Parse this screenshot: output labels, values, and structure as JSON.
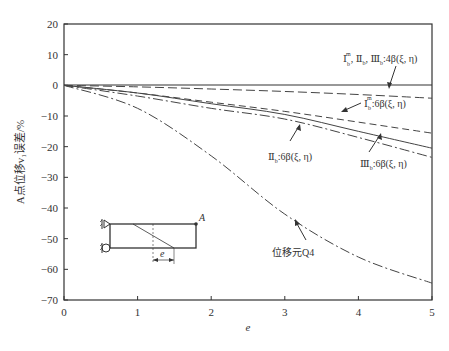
{
  "chart_data": {
    "type": "line",
    "title": "",
    "xlabel": "e",
    "ylabel": "A点位移v₁误差/%",
    "xlim": [
      0,
      5
    ],
    "ylim": [
      -70,
      20
    ],
    "xticks": [
      "0",
      "1",
      "2",
      "3",
      "4",
      "5"
    ],
    "yticks": [
      "20",
      "10",
      "0",
      "-10",
      "-20",
      "-30",
      "-40",
      "-50",
      "-60",
      "-70"
    ],
    "grid": false,
    "x": [
      0,
      1,
      2,
      3,
      4,
      5
    ],
    "series": [
      {
        "name": "Ⅰb^m, Ⅱb, Ⅲb:4β(ξ, η)",
        "style": "long-dash",
        "values": [
          0,
          -0.5,
          -1.2,
          -2.0,
          -3.0,
          -4.2
        ]
      },
      {
        "name": "Ⅰb^m:6β(ξ, η)",
        "style": "dash",
        "values": [
          0,
          -2.5,
          -5.5,
          -8.5,
          -12.0,
          -15.6
        ]
      },
      {
        "name": "Ⅱb:6β(ξ, η)",
        "style": "solid",
        "values": [
          0,
          -2.5,
          -6.0,
          -9.5,
          -15.0,
          -20.5
        ]
      },
      {
        "name": "Ⅲb:6β(ξ, η)",
        "style": "dash-dot",
        "values": [
          0,
          -3.5,
          -7.5,
          -11.0,
          -17.0,
          -23.5
        ]
      },
      {
        "name": "位移元Q4",
        "style": "dash-dot",
        "values": [
          0,
          -7.5,
          -23.0,
          -42.0,
          -56.0,
          -64.5
        ]
      }
    ],
    "annotations": [
      "Ⅰb^m, Ⅱb, Ⅲb:4β(ξ, η)",
      "Ⅰb^m:6β(ξ, η)",
      "Ⅱb:6β(ξ, η)",
      "Ⅲb:6β(ξ, η)",
      "位移元Q4"
    ],
    "inset": {
      "point_label": "A",
      "dimension_label": "e"
    }
  },
  "labels": {
    "ann_4b_main": "Ⅰ",
    "ann_4b_sup": "m",
    "ann_4b_sub": "b",
    "ann_4b_rest1": ", Ⅱ",
    "ann_4b_rest2": ", Ⅲ",
    "ann_4b_tail": ":4β(ξ, η)",
    "ann_I6_main": "Ⅰ",
    "ann_I6_tail": ":6β(ξ, η)",
    "ann_II6_main": "Ⅱ",
    "ann_III6_main": "Ⅲ",
    "ann_q4": "位移元Q4",
    "sub_b": "b",
    "sup_m": "m"
  }
}
